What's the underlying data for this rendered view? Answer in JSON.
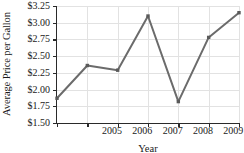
{
  "chart_data": {
    "type": "line",
    "title": "",
    "xlabel": "Year",
    "ylabel": "Average Price per Gallon",
    "categories": [
      "2005",
      "2006",
      "2007",
      "2008",
      "2009",
      "2010",
      "2011"
    ],
    "x": [
      2005,
      2006,
      2007,
      2008,
      2009,
      2010,
      2011
    ],
    "values": [
      1.87,
      2.36,
      2.29,
      3.1,
      1.82,
      2.78,
      3.15
    ],
    "series": [
      {
        "name": "Average Price per Gallon",
        "values": [
          1.87,
          2.36,
          2.29,
          3.1,
          1.82,
          2.78,
          3.15
        ]
      }
    ],
    "ylim": [
      1.5,
      3.25
    ],
    "xlim": [
      2005,
      2011
    ],
    "ytick_values": [
      1.5,
      1.75,
      2.0,
      2.25,
      2.5,
      2.75,
      3.0,
      3.25
    ],
    "ytick_labels": [
      "$1.50",
      "$1.75",
      "$2.00",
      "$2.25",
      "$2.50",
      "$2.75",
      "$3.00",
      "$3.25"
    ],
    "xtick_labels": [
      "2005",
      "2006",
      "2007",
      "2008",
      "2009",
      "2010",
      "2011"
    ],
    "grid": true,
    "legend": "none",
    "marker": "square",
    "line_color": "#6b6b6b",
    "marker_color": "#5a5a5a",
    "grid_color": "#e2e2e2",
    "axis_color": "#2a2a2a",
    "background": "#ffffff"
  }
}
